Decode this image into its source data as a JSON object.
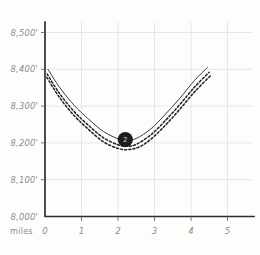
{
  "chart_data": {
    "type": "line",
    "title": "",
    "subtitle": "",
    "xlabel": "miles",
    "ylabel": "",
    "xlim": [
      0,
      5.4
    ],
    "ylim": [
      8000,
      8550
    ],
    "grid": true,
    "legend_position": "none",
    "x_ticks": [
      "0",
      "1",
      "2",
      "3",
      "4",
      "5"
    ],
    "x_tick_values": [
      0,
      1,
      2,
      3,
      4,
      5
    ],
    "y_ticks": [
      "8,000'",
      "8,100'",
      "8,200'",
      "8,300'",
      "8,400'",
      "8,500'"
    ],
    "y_tick_values": [
      8000,
      8100,
      8200,
      8300,
      8400,
      8500
    ],
    "series": [
      {
        "name": "elevation-solid",
        "style": "solid",
        "x": [
          0.08,
          0.4,
          0.8,
          1.2,
          1.6,
          2.0,
          2.2,
          2.5,
          2.9,
          3.3,
          3.7,
          4.1,
          4.45
        ],
        "values": [
          8400,
          8351,
          8302,
          8264,
          8231,
          8211,
          8206,
          8212,
          8238,
          8278,
          8322,
          8370,
          8405
        ]
      },
      {
        "name": "elevation-dashed-upper",
        "style": "dashed",
        "x": [
          0.06,
          0.4,
          0.8,
          1.2,
          1.6,
          2.0,
          2.25,
          2.5,
          2.9,
          3.3,
          3.7,
          4.1,
          4.5
        ],
        "values": [
          8387,
          8334,
          8285,
          8247,
          8214,
          8195,
          8191,
          8196,
          8222,
          8261,
          8305,
          8352,
          8392
        ]
      },
      {
        "name": "elevation-dashed-lower",
        "style": "dashed",
        "x": [
          0.05,
          0.4,
          0.8,
          1.2,
          1.6,
          2.0,
          2.3,
          2.6,
          2.9,
          3.3,
          3.7,
          4.1,
          4.55
        ],
        "values": [
          8378,
          8323,
          8274,
          8236,
          8203,
          8185,
          8182,
          8190,
          8210,
          8248,
          8292,
          8339,
          8384
        ]
      }
    ],
    "annotations": [
      {
        "name": "waypoint-marker",
        "label": "2",
        "x": 2.2,
        "y": 8209
      }
    ],
    "colors": {
      "background": "#fdfdfc",
      "axis": "#2f2f2f",
      "grid": "#dcdcdc",
      "solid_curve": "#3a3a3a",
      "dashed_curve": "#222222",
      "marker_fill": "#1d1d1d",
      "marker_text": "#d8d8d8",
      "tick_text": "#8d8d8d"
    }
  }
}
